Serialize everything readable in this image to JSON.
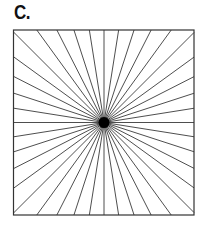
{
  "figure": {
    "label": "C.",
    "square": {
      "left": 13.5,
      "top": 30,
      "right": 194,
      "bottom": 215
    },
    "center": {
      "x": 104,
      "y": 122.5,
      "radius": 5.5
    },
    "ray_count": 40,
    "ray_angle_step_deg": 9,
    "colors": {
      "background": "#ffffff",
      "line": "#3a3a3a",
      "frame": "#333333",
      "center": "#000000",
      "label": "#111111"
    }
  }
}
